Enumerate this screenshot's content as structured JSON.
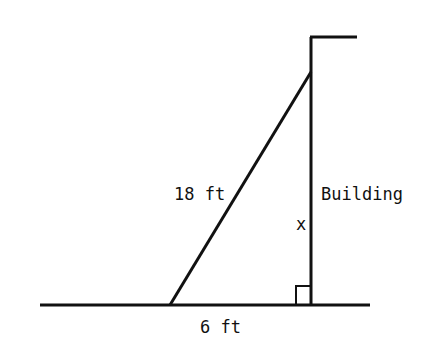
{
  "diagram": {
    "type": "right-triangle-ladder-building",
    "labels": {
      "hypotenuse": "18 ft",
      "base": "6 ft",
      "height": "x",
      "building": "Building"
    },
    "colors": {
      "stroke": "#111111",
      "background": "#ffffff"
    }
  }
}
